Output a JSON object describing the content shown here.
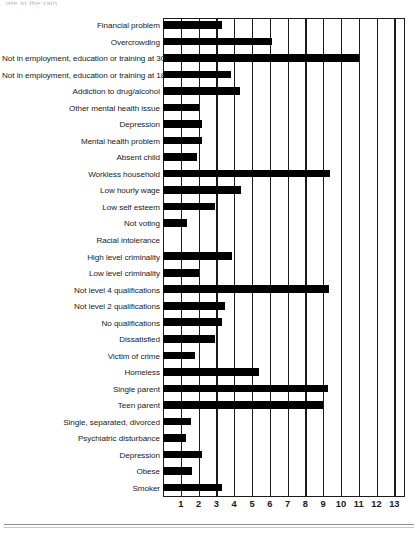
{
  "top_fragment": "ate in the rain",
  "chart_data": {
    "type": "bar",
    "orientation": "horizontal",
    "title": "",
    "subtitle": "",
    "xlabel": "",
    "ylabel": "",
    "xlim": [
      0,
      13.6
    ],
    "xticks": [
      1,
      2,
      3,
      4,
      5,
      6,
      7,
      8,
      9,
      10,
      11,
      12,
      13
    ],
    "grid": "vertical",
    "legend": "none",
    "bar_color": "#000000",
    "categories": [
      "Financial problem",
      "Overcrowding",
      "Not in employment, education or training at 30",
      "Not in employment, education or training at 18",
      "Addiction to drug/alcohol",
      "Other mental health issue",
      "Depression",
      "Mental health problem",
      "Absent child",
      "Workless household",
      "Low hourly wage",
      "Low self esteem",
      "Not voting",
      "Racial intolerance",
      "High level criminality",
      "Low level criminality",
      "Not level 4 qualifications",
      "Not level 2 qualifications",
      "No qualifications",
      "Dissatisfied",
      "Victim of crime",
      "Homeless",
      "Single parent",
      "Teen parent",
      "Single, separated, divorced",
      "Psychiatric disturbance",
      "Depression",
      "Obese",
      "Smoker"
    ],
    "values": [
      3.3,
      6.1,
      11.0,
      3.8,
      4.3,
      2.0,
      2.2,
      2.2,
      1.9,
      9.4,
      4.4,
      2.9,
      1.35,
      0,
      3.9,
      2.05,
      9.35,
      3.5,
      3.3,
      2.9,
      1.8,
      5.4,
      9.3,
      9.0,
      1.55,
      1.3,
      2.2,
      1.65,
      3.3
    ]
  }
}
